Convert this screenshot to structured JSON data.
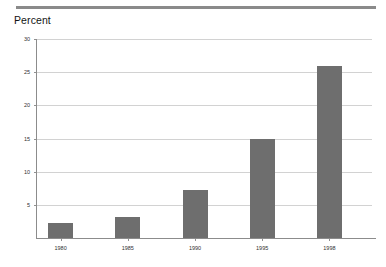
{
  "header": {
    "rule_color": "#8a8a8a"
  },
  "chart_data": {
    "type": "bar",
    "title": "",
    "ylabel": "Percent",
    "xlabel": "",
    "categories": [
      "1980",
      "1985",
      "1990",
      "1995",
      "1998"
    ],
    "values": [
      2.2,
      3.2,
      7.3,
      15.0,
      26.0
    ],
    "ylim": [
      0,
      30
    ],
    "yticks": [
      5,
      10,
      15,
      20,
      25,
      30
    ],
    "ytick_labels": [
      "5",
      "10",
      "15",
      "20",
      "25",
      "30"
    ],
    "grid": true,
    "legend": null,
    "bar_color": "#6e6e6e",
    "gridline_color": "#d2d2d2",
    "axis_color": "#8c8c8c"
  }
}
